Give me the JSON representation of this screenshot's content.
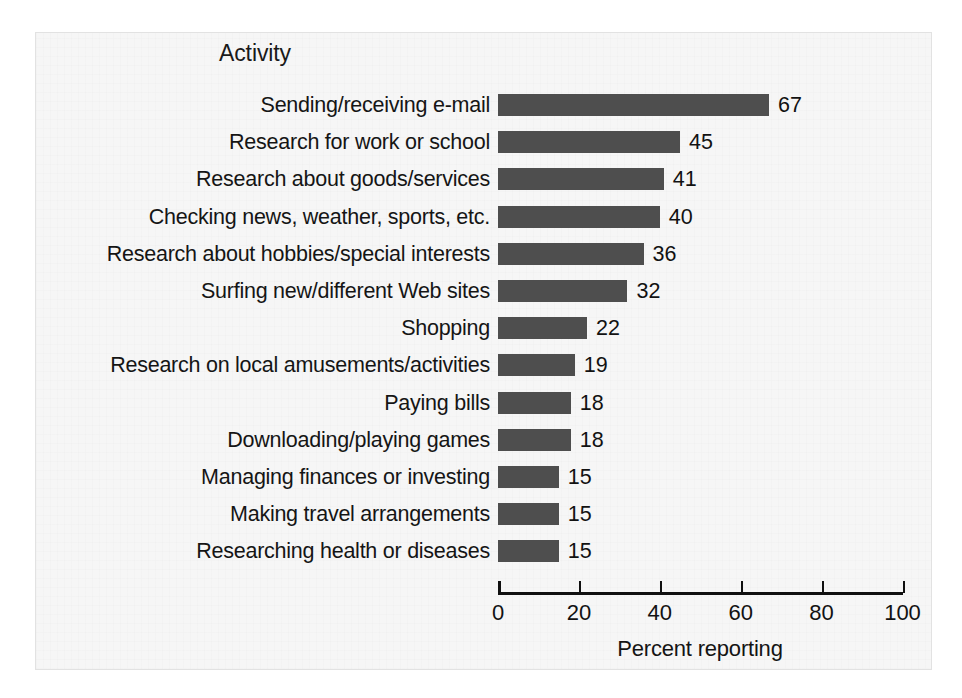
{
  "figure": {
    "background_color": "#f6f6f6",
    "frame_border_color": "#e2e2e2",
    "bar_color": "#4e4e4e",
    "text_color": "#151515"
  },
  "chart_data": {
    "type": "bar",
    "orientation": "horizontal",
    "title": "Activity",
    "xlabel": "Percent reporting",
    "ylabel": "",
    "xlim": [
      0,
      100
    ],
    "xticks": [
      0,
      20,
      40,
      60,
      80,
      100
    ],
    "xtick_labels": [
      "0",
      "20",
      "40",
      "60",
      "80",
      "100"
    ],
    "grid": false,
    "legend": false,
    "data_labels": true,
    "categories": [
      "Sending/receiving e-mail",
      "Research for work or school",
      "Research about goods/services",
      "Checking news, weather, sports, etc.",
      "Research about hobbies/special interests",
      "Surfing new/different Web sites",
      "Shopping",
      "Research on local amusements/activities",
      "Paying bills",
      "Downloading/playing games",
      "Managing finances or investing",
      "Making travel arrangements",
      "Researching health or diseases"
    ],
    "values": [
      67,
      45,
      41,
      40,
      36,
      32,
      22,
      19,
      18,
      18,
      15,
      15,
      15
    ],
    "value_labels": [
      "67",
      "45",
      "41",
      "40",
      "36",
      "32",
      "22",
      "19",
      "18",
      "18",
      "15",
      "15",
      "15"
    ]
  }
}
